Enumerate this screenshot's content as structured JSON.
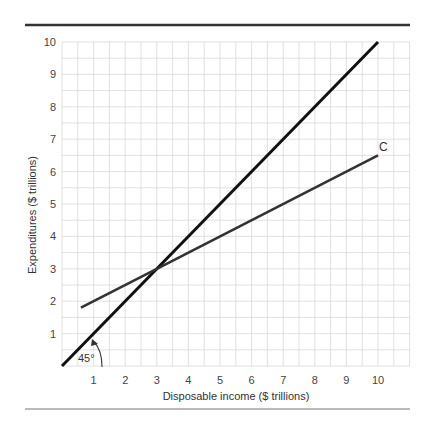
{
  "chart_data": {
    "type": "line",
    "title": "",
    "xlabel": "Disposable income ($ trillions)",
    "ylabel": "Expenditures ($ trillions)",
    "xlim": [
      0,
      11
    ],
    "ylim": [
      0,
      10
    ],
    "x_ticks": [
      1,
      2,
      3,
      4,
      5,
      6,
      7,
      8,
      9,
      10
    ],
    "y_ticks": [
      1,
      2,
      3,
      4,
      5,
      6,
      7,
      8,
      9,
      10
    ],
    "grid": true,
    "grid_step": 0.5,
    "series": [
      {
        "name": "45-degree line",
        "points": [
          [
            0,
            0
          ],
          [
            10,
            10
          ]
        ],
        "color": "#111111"
      },
      {
        "name": "C",
        "label": "C",
        "points": [
          [
            0.6,
            1.8
          ],
          [
            3,
            3
          ],
          [
            10,
            6.5
          ]
        ],
        "color": "#333333"
      }
    ],
    "annotations": [
      {
        "text": "45°",
        "type": "angle-arc",
        "at": [
          1,
          0
        ]
      },
      {
        "text": "C",
        "type": "series-label",
        "at": [
          10.2,
          6.8
        ]
      }
    ],
    "intersection": [
      3,
      3
    ]
  }
}
